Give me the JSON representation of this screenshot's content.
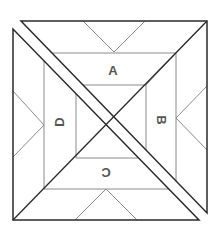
{
  "diagram": {
    "labels": [
      {
        "id": "A",
        "text": "A",
        "rotation": 0
      },
      {
        "id": "B",
        "text": "B",
        "rotation": 90
      },
      {
        "id": "C",
        "text": "C",
        "rotation": 180
      },
      {
        "id": "D",
        "text": "D",
        "rotation": -90
      }
    ],
    "colors": {
      "outline": "#2a2a2a",
      "thin_line": "#8a8a8a",
      "label": "#555555",
      "background": "#ffffff"
    }
  }
}
